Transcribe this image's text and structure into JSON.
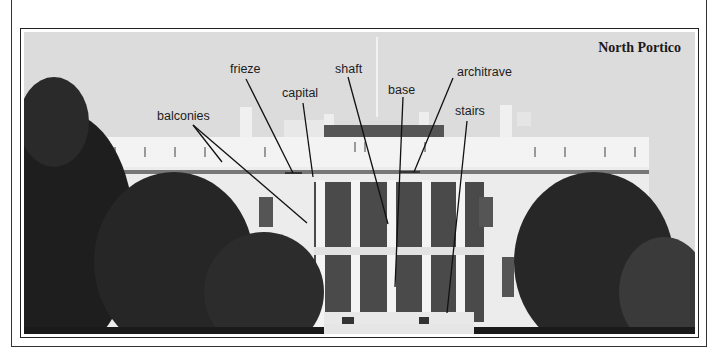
{
  "figure": {
    "caption": "North Portico",
    "labels": [
      {
        "id": "balconies",
        "text": "balconies",
        "x": 157,
        "y": 110
      },
      {
        "id": "frieze",
        "text": "frieze",
        "x": 230,
        "y": 63
      },
      {
        "id": "capital",
        "text": "capital",
        "x": 282,
        "y": 87
      },
      {
        "id": "shaft",
        "text": "shaft",
        "x": 335,
        "y": 63
      },
      {
        "id": "base",
        "text": "base",
        "x": 388,
        "y": 84
      },
      {
        "id": "architrave",
        "text": "architrave",
        "x": 457,
        "y": 66
      },
      {
        "id": "stairs",
        "text": "stairs",
        "x": 455,
        "y": 105
      }
    ]
  }
}
